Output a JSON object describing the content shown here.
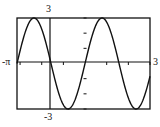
{
  "chart_data": {
    "type": "line",
    "title": "",
    "function": "y = 3 sin(2x)",
    "xlabel": "",
    "ylabel": "",
    "xlim": [
      -3.14159,
      3
    ],
    "ylim": [
      -3,
      3
    ],
    "grid": false,
    "legend": null,
    "tick_labels": {
      "x_min": "-π",
      "x_max": "3",
      "y_max": "3",
      "y_min": "-3"
    },
    "x_tick_step": 1,
    "y_tick_step": 1,
    "series": [
      {
        "name": "f(x)",
        "x": [
          -3.14,
          -2.36,
          -1.57,
          -0.79,
          0,
          0.79,
          1.57,
          2.36,
          3.0
        ],
        "values": [
          0,
          3,
          0,
          -3,
          0,
          3,
          0,
          -3,
          -0.84
        ]
      }
    ],
    "key_points": {
      "zeros": [
        -3.14,
        -1.57,
        0,
        1.57
      ],
      "maxima": [
        [
          -2.36,
          3
        ],
        [
          0.79,
          3
        ]
      ],
      "minima": [
        [
          -0.79,
          -3
        ],
        [
          2.36,
          -3
        ]
      ]
    },
    "colors": {
      "curve": "#111111",
      "frame": "#111111",
      "axes": "#111111"
    }
  }
}
